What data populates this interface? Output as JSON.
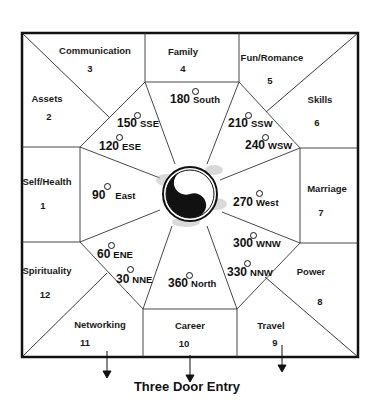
{
  "diagram": {
    "title": "Three Door Entry",
    "colors": {
      "line": "#111111",
      "background": "#ffffff",
      "smudge": "#bbbbbb"
    }
  },
  "areas": [
    {
      "label": "Self/Health",
      "number": "1"
    },
    {
      "label": "Assets",
      "number": "2"
    },
    {
      "label": "Communication",
      "number": "3"
    },
    {
      "label": "Family",
      "number": "4"
    },
    {
      "label": "Fun/Romance",
      "number": "5"
    },
    {
      "label": "Skills",
      "number": "6"
    },
    {
      "label": "Marriage",
      "number": "7"
    },
    {
      "label": "Power",
      "number": "8"
    },
    {
      "label": "Travel",
      "number": "9"
    },
    {
      "label": "Career",
      "number": "10"
    },
    {
      "label": "Networking",
      "number": "11"
    },
    {
      "label": "Spirituality",
      "number": "12"
    }
  ],
  "directions": [
    {
      "degrees": "180",
      "compass": "South"
    },
    {
      "degrees": "150",
      "compass": "SSE"
    },
    {
      "degrees": "120",
      "compass": "ESE"
    },
    {
      "degrees": "210",
      "compass": "SSW"
    },
    {
      "degrees": "240",
      "compass": "WSW"
    },
    {
      "degrees": "90",
      "compass": "East"
    },
    {
      "degrees": "270",
      "compass": "West"
    },
    {
      "degrees": "60",
      "compass": "ENE"
    },
    {
      "degrees": "30",
      "compass": "NNE"
    },
    {
      "degrees": "300",
      "compass": "WNW"
    },
    {
      "degrees": "330",
      "compass": "NNW"
    },
    {
      "degrees": "360",
      "compass": "North"
    }
  ],
  "center_icon": "yin-yang-icon",
  "entry_arrows": 3
}
